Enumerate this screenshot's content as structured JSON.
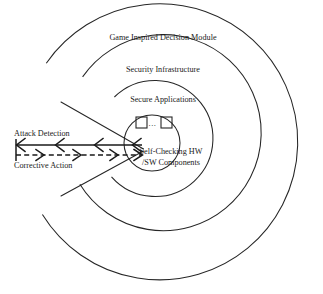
{
  "figure": {
    "type": "concentric-layer-diagram",
    "background_color": "#ffffff",
    "stroke_color": "#262626",
    "text_color": "#1a1a1a"
  },
  "rings": [
    {
      "id": "outer",
      "label": "Game Inspired Decision Module",
      "level": 1,
      "radius": 138,
      "label_x": 163,
      "label_y": 38
    },
    {
      "id": "second",
      "label": "Security Infrastructure",
      "level": 2,
      "radius": 98,
      "label_x": 163,
      "label_y": 70
    },
    {
      "id": "third",
      "label": "Secure Applications",
      "level": 3,
      "radius": 58,
      "label_x": 163,
      "label_y": 100
    },
    {
      "id": "core",
      "label": "",
      "level": 4,
      "radius": 28,
      "label_x": 0,
      "label_y": 0
    }
  ],
  "core": {
    "line1": "Self-Checking HW",
    "line2": "/SW Components",
    "line1_x": 171,
    "line1_y": 152,
    "line2_x": 171,
    "line2_y": 163,
    "ellipsis": "...",
    "ellipsis_x": 152,
    "ellipsis_y": 124,
    "components": [
      {
        "id": "component-1",
        "x": 136,
        "y": 117,
        "w": 11,
        "h": 11
      },
      {
        "id": "component-2",
        "x": 161,
        "y": 117,
        "w": 11,
        "h": 11
      }
    ]
  },
  "arrows": [
    {
      "id": "attack-detection",
      "label": "Attack Detection",
      "direction": "outward-left",
      "style": "solid",
      "label_x": 14,
      "label_y": 134,
      "line_y": 145,
      "x_start": 142,
      "x_end": 16
    },
    {
      "id": "corrective-action",
      "label": "Corrective Action",
      "direction": "inward-right",
      "style": "dashed",
      "label_x": 14,
      "label_y": 166,
      "line_y": 155,
      "x_start": 16,
      "x_end": 142
    }
  ],
  "wedge": {
    "apex_x": 142,
    "apex_y": 150,
    "upper_edge_end_x": 61,
    "upper_edge_end_y": 102,
    "lower_edge_end_x": 61,
    "lower_edge_end_y": 196
  }
}
